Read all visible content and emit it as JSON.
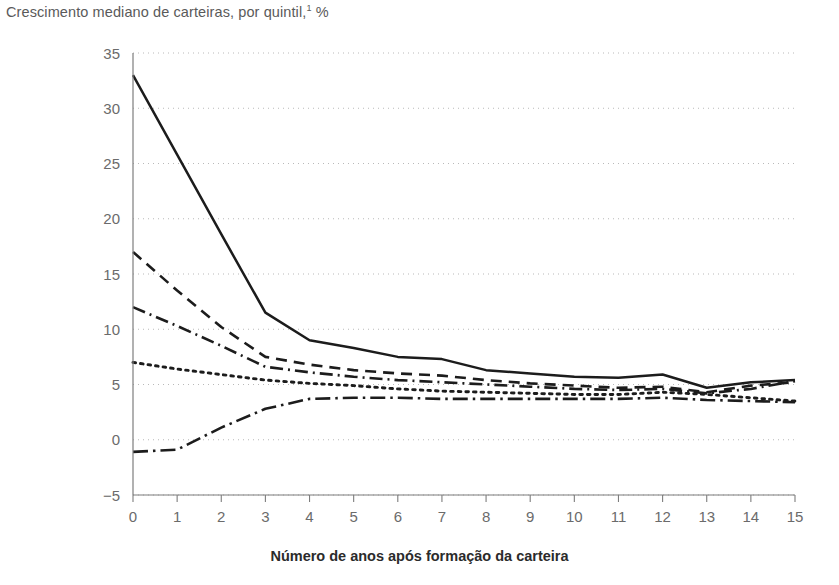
{
  "chart_data": {
    "type": "line",
    "title": "Crescimento mediano de carteiras, por quintil,",
    "title_footnote_marker": "1",
    "title_unit": " %",
    "xlabel": "Número de anos após formação da carteira",
    "ylabel": "",
    "xlim": [
      0,
      15
    ],
    "ylim": [
      -5,
      35
    ],
    "grid": true,
    "legend_position": "none",
    "x_ticks": [
      "0",
      "1",
      "2",
      "3",
      "4",
      "5",
      "6",
      "7",
      "8",
      "9",
      "10",
      "11",
      "12",
      "13",
      "14",
      "15"
    ],
    "y_ticks": [
      "35",
      "30",
      "25",
      "20",
      "15",
      "10",
      "5",
      "0",
      "−5"
    ],
    "x": [
      0,
      1,
      2,
      3,
      4,
      5,
      6,
      7,
      8,
      9,
      10,
      11,
      12,
      13,
      14,
      15
    ],
    "series": [
      {
        "name": "Quintil 5 (maior crescimento)",
        "style": "solid",
        "values": [
          33.0,
          25.8,
          18.6,
          11.5,
          9.0,
          8.3,
          7.5,
          7.3,
          6.3,
          6.0,
          5.7,
          5.6,
          5.9,
          4.7,
          5.2,
          5.4
        ]
      },
      {
        "name": "Quintil 4",
        "style": "dashed",
        "values": [
          17.0,
          13.5,
          10.2,
          7.5,
          6.8,
          6.3,
          6.0,
          5.8,
          5.4,
          5.1,
          4.9,
          4.7,
          4.8,
          4.3,
          4.9,
          5.2
        ]
      },
      {
        "name": "Quintil 3",
        "style": "dash-dot",
        "values": [
          12.0,
          10.3,
          8.5,
          6.6,
          6.1,
          5.7,
          5.4,
          5.2,
          5.0,
          4.8,
          4.6,
          4.5,
          4.6,
          4.2,
          4.6,
          5.3
        ]
      },
      {
        "name": "Quintil 2",
        "style": "dotted",
        "values": [
          7.0,
          6.4,
          5.9,
          5.4,
          5.1,
          4.9,
          4.6,
          4.4,
          4.3,
          4.2,
          4.1,
          4.1,
          4.3,
          4.1,
          3.8,
          3.5
        ]
      },
      {
        "name": "Quintil 1 (menor crescimento)",
        "style": "dash-dot-dot",
        "values": [
          -1.1,
          -0.9,
          1.1,
          2.8,
          3.7,
          3.8,
          3.8,
          3.7,
          3.7,
          3.7,
          3.7,
          3.7,
          3.8,
          3.6,
          3.5,
          3.4
        ]
      }
    ]
  }
}
